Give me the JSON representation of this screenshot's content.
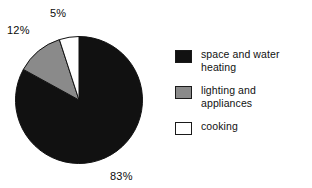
{
  "chart_data": {
    "type": "pie",
    "title": "",
    "subtitle": "",
    "xlabel": "",
    "ylabel": "",
    "grid": false,
    "legend_position": "right",
    "start_angle_deg": 0,
    "direction": "counterclockwise",
    "categories": [
      "space and water heating",
      "lighting and appliances",
      "cooking"
    ],
    "values": [
      83,
      12,
      5
    ],
    "unit": "%",
    "data_labels": [
      "83%",
      "12%",
      "5%"
    ],
    "colors": [
      "#111111",
      "#8a8a8a",
      "#ffffff"
    ],
    "slices": [
      {
        "label": "space and water heating",
        "legend_label": "space and water\nheating",
        "value": 83,
        "data_label": "83%",
        "color": "#111111",
        "swatch": "black"
      },
      {
        "label": "lighting and appliances",
        "legend_label": "lighting and appliances",
        "value": 12,
        "data_label": "12%",
        "color": "#8a8a8a",
        "swatch": "gray"
      },
      {
        "label": "cooking",
        "legend_label": "cooking",
        "value": 5,
        "data_label": "5%",
        "color": "#ffffff",
        "swatch": "white"
      }
    ]
  },
  "labels": {
    "heating_pct": "83%",
    "lighting_pct": "12%",
    "cooking_pct": "5%"
  },
  "legend": {
    "items": [
      {
        "label": "space and water\nheating",
        "color": "#111111"
      },
      {
        "label": "lighting and appliances",
        "color": "#8a8a8a"
      },
      {
        "label": "cooking",
        "color": "#ffffff"
      }
    ]
  },
  "style": {
    "background": "#ffffff",
    "outline": "#111111",
    "text": "#111111"
  }
}
